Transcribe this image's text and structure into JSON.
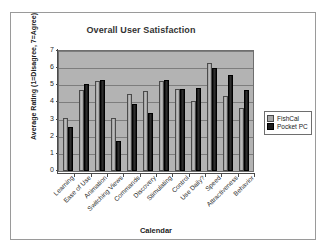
{
  "chart_data": {
    "type": "bar",
    "title": "Overall User Satisfaction",
    "xlabel": "Calendar",
    "ylabel": "Average Rating (1=Disagree, 7=Agree)",
    "ylim": [
      0,
      7
    ],
    "yticks": [
      0,
      1,
      2,
      3,
      4,
      5,
      6,
      7
    ],
    "grid": true,
    "legend_position": "right",
    "categories": [
      "Learning",
      "Ease of Use",
      "Animation",
      "Switching Views",
      "Commands",
      "Discovery",
      "Stimulating",
      "Control",
      "Use Daily?",
      "Speed",
      "Attractiveness",
      "Behavior"
    ],
    "series": [
      {
        "name": "FishCal",
        "color": "#a8a8a8",
        "values": [
          3.1,
          4.7,
          5.25,
          3.1,
          4.5,
          4.65,
          5.25,
          4.8,
          4.1,
          6.3,
          4.4,
          3.65
        ]
      },
      {
        "name": "Pocket PC",
        "color": "#1c1c1c",
        "values": [
          2.55,
          5.1,
          5.3,
          1.75,
          3.9,
          3.4,
          5.3,
          4.8,
          4.85,
          6.0,
          5.6,
          4.7
        ]
      }
    ]
  }
}
